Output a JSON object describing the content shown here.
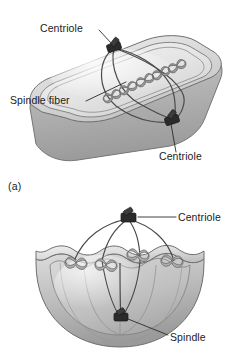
{
  "figure": {
    "background_color": "#ffffff",
    "panels": [
      {
        "id": "a",
        "caption": "(a)",
        "shape": "rounded-rectangular-cell",
        "labels": [
          {
            "name": "centriole-top",
            "text": "Centriole"
          },
          {
            "name": "spindle-fiber",
            "text": "Spindle fiber"
          },
          {
            "name": "centriole-bottom",
            "text": "Centriole"
          }
        ]
      },
      {
        "id": "b",
        "caption": "(b)",
        "shape": "cutaway-hemisphere-cell",
        "labels": [
          {
            "name": "centriole-top",
            "text": "Centriole"
          },
          {
            "name": "spindle",
            "text": "Spindle"
          }
        ]
      }
    ]
  },
  "colors": {
    "background": "#ffffff",
    "cell_light": "#e2e2e2",
    "cell_mid": "#c4c4c4",
    "cell_dark": "#9d9d9d",
    "cell_shadow": "#8a8a8a",
    "membrane_line": "#6f6f6f",
    "fiber": "#4a4a4a",
    "centriole": "#2b2b2b",
    "chromosome": "#8d8d8d",
    "chromosome_outline": "#5e5e5e",
    "text": "#1b1b1b",
    "leader_line": "#2a2a2a"
  },
  "panel_a": {
    "caption": "(a)",
    "structures": {
      "cell_name": "cell-body",
      "membrane_name": "cell-membrane",
      "centriole_count": 2,
      "spindle_fiber_count": 4,
      "chromosome_count": 5
    },
    "callouts": {
      "centriole_top": {
        "text": "Centriole",
        "text_x": 40,
        "text_y": 32,
        "anchor_x": 112,
        "anchor_y": 47
      },
      "spindle_fiber": {
        "text": "Spindle fiber",
        "text_x": 10,
        "text_y": 104,
        "anchor_x": 126,
        "anchor_y": 83
      },
      "centriole_bottom": {
        "text": "Centriole",
        "text_x": 159,
        "text_y": 159,
        "anchor_x": 172,
        "anchor_y": 121
      }
    }
  },
  "panel_b": {
    "caption": "(b)",
    "structures": {
      "cell_name": "cell-body-cutaway",
      "centriole_count": 2,
      "spindle_fiber_count": 4,
      "chromosome_count": 4
    },
    "callouts": {
      "centriole_top": {
        "text": "Centriole",
        "text_x": 178,
        "text_y": 36,
        "anchor_x": 131,
        "anchor_y": 32
      },
      "spindle": {
        "text": "Spindle",
        "text_x": 170,
        "text_y": 152,
        "anchor_x": 131,
        "anchor_y": 131
      }
    }
  }
}
